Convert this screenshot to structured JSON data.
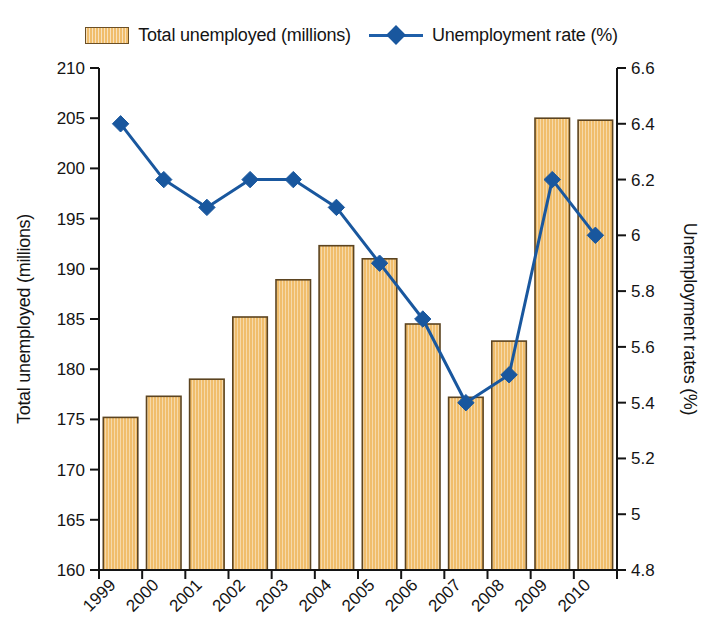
{
  "legend": {
    "items": [
      {
        "label": "Total unemployed (millions)",
        "marker": "bar-swatch-icon",
        "color": "#f0bd6b"
      },
      {
        "label": "Unemployment rate (%)",
        "marker": "line-diamond-icon",
        "color": "#19579e"
      }
    ]
  },
  "chart_data": {
    "type": "bar",
    "title": "",
    "subtitle": "",
    "xlabel": "",
    "categories": [
      "1999",
      "2000",
      "2001",
      "2002",
      "2003",
      "2004",
      "2005",
      "2006",
      "2007",
      "2008",
      "2009",
      "2010"
    ],
    "grid": false,
    "legend_position": "top",
    "axes": {
      "left": {
        "label": "Total unemployed (millions)",
        "min": 160,
        "max": 210,
        "step": 5,
        "ticks": [
          "160",
          "165",
          "170",
          "175",
          "180",
          "185",
          "190",
          "195",
          "200",
          "205",
          "210"
        ]
      },
      "right": {
        "label": "Unemployment rates (%)",
        "min": 4.8,
        "max": 6.6,
        "step": 0.2,
        "ticks": [
          "4.8",
          "5",
          "5.2",
          "5.4",
          "5.6",
          "5.8",
          "6",
          "6.2",
          "6.4",
          "6.6"
        ]
      }
    },
    "series": [
      {
        "name": "Total unemployed (millions)",
        "type": "bar",
        "axis": "left",
        "color": "#f0bd6b",
        "edge_color": "#5c4420",
        "values": [
          175.2,
          177.3,
          179.0,
          185.2,
          188.9,
          192.3,
          191.0,
          184.5,
          177.2,
          182.8,
          205.0,
          204.8
        ]
      },
      {
        "name": "Unemployment rate (%)",
        "type": "line",
        "axis": "right",
        "color": "#19579e",
        "marker": "diamond",
        "values": [
          6.4,
          6.2,
          6.1,
          6.2,
          6.2,
          6.1,
          5.9,
          5.7,
          5.4,
          5.5,
          6.2,
          6.0
        ]
      }
    ]
  }
}
